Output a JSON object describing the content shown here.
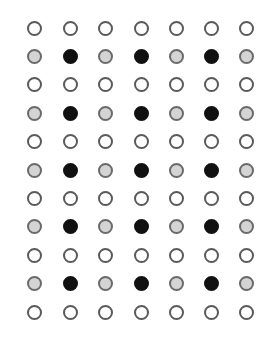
{
  "grid": {
    "rows": 11,
    "cols": 7,
    "col_x": [
      34,
      70,
      105,
      141,
      176,
      211,
      246
    ],
    "row_y_start": 28,
    "row_step": 28.4,
    "pattern": [
      [
        "white",
        "white",
        "white",
        "white",
        "white",
        "white",
        "white"
      ],
      [
        "gray",
        "black",
        "gray",
        "black",
        "gray",
        "black",
        "gray"
      ],
      [
        "white",
        "white",
        "white",
        "white",
        "white",
        "white",
        "white"
      ],
      [
        "gray",
        "black",
        "gray",
        "black",
        "gray",
        "black",
        "gray"
      ],
      [
        "white",
        "white",
        "white",
        "white",
        "white",
        "white",
        "white"
      ],
      [
        "gray",
        "black",
        "gray",
        "black",
        "gray",
        "black",
        "gray"
      ],
      [
        "white",
        "white",
        "white",
        "white",
        "white",
        "white",
        "white"
      ],
      [
        "gray",
        "black",
        "gray",
        "black",
        "gray",
        "black",
        "gray"
      ],
      [
        "white",
        "white",
        "white",
        "white",
        "white",
        "white",
        "white"
      ],
      [
        "gray",
        "black",
        "gray",
        "black",
        "gray",
        "black",
        "gray"
      ],
      [
        "white",
        "white",
        "white",
        "white",
        "white",
        "white",
        "white"
      ]
    ]
  },
  "colors": {
    "white": {
      "fill": "#ffffff",
      "stroke": "#5a5a5a"
    },
    "gray": {
      "fill": "#d4d4d4",
      "stroke": "#6a6a6a"
    },
    "black": {
      "fill": "#111111",
      "stroke": "#111111"
    }
  }
}
